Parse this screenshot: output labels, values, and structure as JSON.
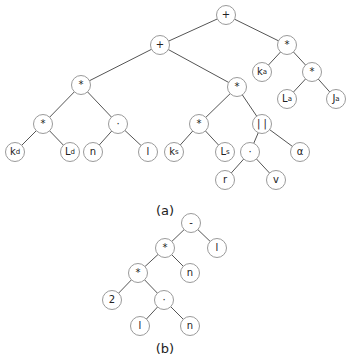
{
  "figure": {
    "tree_a": {
      "caption": "(a)",
      "caption_pos": [
        165,
        210
      ],
      "nodes": [
        {
          "id": "a0",
          "label": "+",
          "x": 226,
          "y": 15
        },
        {
          "id": "a1",
          "label": "+",
          "x": 160,
          "y": 45
        },
        {
          "id": "a2",
          "label": "*",
          "x": 287,
          "y": 45
        },
        {
          "id": "a3",
          "label": "k",
          "sub": "a",
          "x": 262,
          "y": 72
        },
        {
          "id": "a4",
          "label": "*",
          "x": 312,
          "y": 72
        },
        {
          "id": "a5",
          "label": "L",
          "sub": "a",
          "x": 287,
          "y": 99
        },
        {
          "id": "a6",
          "label": "J",
          "sub": "a",
          "x": 336,
          "y": 99
        },
        {
          "id": "a7",
          "label": "*",
          "x": 81,
          "y": 85
        },
        {
          "id": "a8",
          "label": "*",
          "x": 237,
          "y": 87
        },
        {
          "id": "a9",
          "label": "*",
          "x": 43,
          "y": 124
        },
        {
          "id": "a10",
          "label": "·",
          "x": 118,
          "y": 124
        },
        {
          "id": "a11",
          "label": "k",
          "sub": "d",
          "x": 15,
          "y": 152
        },
        {
          "id": "a12",
          "label": "L",
          "sub": "d",
          "x": 70,
          "y": 152
        },
        {
          "id": "a13",
          "label": "n",
          "x": 93,
          "y": 152
        },
        {
          "id": "a14",
          "label": "l",
          "x": 148,
          "y": 152
        },
        {
          "id": "a15",
          "label": "*",
          "x": 199,
          "y": 124
        },
        {
          "id": "a16",
          "label": "| |",
          "x": 262,
          "y": 124
        },
        {
          "id": "a17",
          "label": "k",
          "sub": "s",
          "x": 174,
          "y": 152
        },
        {
          "id": "a18",
          "label": "L",
          "sub": "s",
          "x": 225,
          "y": 152
        },
        {
          "id": "a19",
          "label": "·",
          "x": 250,
          "y": 152
        },
        {
          "id": "a20",
          "label": "α",
          "x": 300,
          "y": 152
        },
        {
          "id": "a21",
          "label": "r",
          "x": 225,
          "y": 180
        },
        {
          "id": "a22",
          "label": "v",
          "x": 276,
          "y": 180
        }
      ],
      "edges": [
        [
          "a0",
          "a1"
        ],
        [
          "a0",
          "a2"
        ],
        [
          "a2",
          "a3"
        ],
        [
          "a2",
          "a4"
        ],
        [
          "a4",
          "a5"
        ],
        [
          "a4",
          "a6"
        ],
        [
          "a1",
          "a7"
        ],
        [
          "a1",
          "a8"
        ],
        [
          "a7",
          "a9"
        ],
        [
          "a7",
          "a10"
        ],
        [
          "a9",
          "a11"
        ],
        [
          "a9",
          "a12"
        ],
        [
          "a10",
          "a13"
        ],
        [
          "a10",
          "a14"
        ],
        [
          "a8",
          "a15"
        ],
        [
          "a8",
          "a16"
        ],
        [
          "a15",
          "a17"
        ],
        [
          "a15",
          "a18"
        ],
        [
          "a16",
          "a19"
        ],
        [
          "a16",
          "a20"
        ],
        [
          "a19",
          "a21"
        ],
        [
          "a19",
          "a22"
        ]
      ]
    },
    "tree_b": {
      "caption": "(b)",
      "caption_pos": [
        165,
        348
      ],
      "nodes": [
        {
          "id": "b0",
          "label": "-",
          "x": 191,
          "y": 223
        },
        {
          "id": "b1",
          "label": "*",
          "x": 165,
          "y": 248
        },
        {
          "id": "b2",
          "label": "l",
          "x": 217,
          "y": 248
        },
        {
          "id": "b3",
          "label": "*",
          "x": 138,
          "y": 273
        },
        {
          "id": "b4",
          "label": "n",
          "x": 190,
          "y": 273
        },
        {
          "id": "b5",
          "label": "2",
          "x": 112,
          "y": 300
        },
        {
          "id": "b6",
          "label": "·",
          "x": 164,
          "y": 300
        },
        {
          "id": "b7",
          "label": "l",
          "x": 140,
          "y": 326
        },
        {
          "id": "b8",
          "label": "n",
          "x": 190,
          "y": 326
        }
      ],
      "edges": [
        [
          "b0",
          "b1"
        ],
        [
          "b0",
          "b2"
        ],
        [
          "b1",
          "b3"
        ],
        [
          "b1",
          "b4"
        ],
        [
          "b3",
          "b5"
        ],
        [
          "b3",
          "b6"
        ],
        [
          "b6",
          "b7"
        ],
        [
          "b6",
          "b8"
        ]
      ]
    }
  }
}
